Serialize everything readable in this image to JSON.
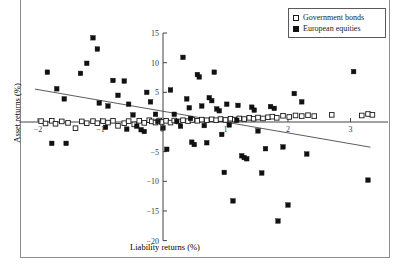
{
  "chart_data": {
    "type": "scatter",
    "title": "",
    "xlabel": "Liability returns (%)",
    "ylabel": "Asset returns (%)",
    "xlim": [
      -2.3,
      3.6
    ],
    "ylim": [
      -21,
      16
    ],
    "xticks": [
      -2,
      -1,
      0,
      1,
      2,
      3
    ],
    "xtick_labels": [
      "−2",
      "−1",
      "0",
      "1",
      "2",
      "3"
    ],
    "yticks": [
      15,
      10,
      5,
      0,
      -5,
      -10,
      -15,
      -20
    ],
    "ytick_labels": [
      "15",
      "10",
      "5",
      "0",
      "−5",
      "−10",
      "−15",
      "−20"
    ],
    "grid": false,
    "legend_position": "top-right",
    "series": [
      {
        "name": "Government bonds",
        "marker": "open-square",
        "color": "#ffffff",
        "edge_color": "#1a1a1a",
        "points": [
          [
            -1.95,
            0.15
          ],
          [
            -1.88,
            -0.25
          ],
          [
            -1.78,
            0.2
          ],
          [
            -1.72,
            -0.3
          ],
          [
            -1.62,
            0.1
          ],
          [
            -1.52,
            -0.15
          ],
          [
            -1.4,
            -1.05
          ],
          [
            -1.3,
            0.1
          ],
          [
            -1.22,
            -0.2
          ],
          [
            -1.12,
            0.15
          ],
          [
            -1.05,
            -0.2
          ],
          [
            -0.96,
            0.15
          ],
          [
            -0.88,
            -0.1
          ],
          [
            -0.8,
            0.2
          ],
          [
            -0.72,
            -0.65
          ],
          [
            -0.62,
            -0.2
          ],
          [
            -0.55,
            0.15
          ],
          [
            -0.46,
            -0.4
          ],
          [
            -0.38,
            0.2
          ],
          [
            -0.3,
            -0.15
          ],
          [
            -0.22,
            0.3
          ],
          [
            -0.18,
            0.1
          ],
          [
            -0.12,
            -0.1
          ],
          [
            -0.06,
            0.25
          ],
          [
            -0.02,
            0.0
          ],
          [
            0.05,
            0.2
          ],
          [
            0.12,
            -0.1
          ],
          [
            0.18,
            0.25
          ],
          [
            0.25,
            0.1
          ],
          [
            0.32,
            0.3
          ],
          [
            0.4,
            0.15
          ],
          [
            0.47,
            0.35
          ],
          [
            0.55,
            0.2
          ],
          [
            0.62,
            0.4
          ],
          [
            0.7,
            0.3
          ],
          [
            0.78,
            0.45
          ],
          [
            0.85,
            0.3
          ],
          [
            0.92,
            0.5
          ],
          [
            1.0,
            0.35
          ],
          [
            1.08,
            0.55
          ],
          [
            1.15,
            0.4
          ],
          [
            1.22,
            0.6
          ],
          [
            1.3,
            0.5
          ],
          [
            1.38,
            0.7
          ],
          [
            1.45,
            0.55
          ],
          [
            1.52,
            0.75
          ],
          [
            1.6,
            0.6
          ],
          [
            1.68,
            0.8
          ],
          [
            1.75,
            0.9
          ],
          [
            1.82,
            0.7
          ],
          [
            1.92,
            1.05
          ],
          [
            2.02,
            0.85
          ],
          [
            2.12,
            1.1
          ],
          [
            2.22,
            1.0
          ],
          [
            2.32,
            1.15
          ],
          [
            2.42,
            1.0
          ],
          [
            2.7,
            1.2
          ],
          [
            3.18,
            1.1
          ],
          [
            3.28,
            1.35
          ],
          [
            3.35,
            1.2
          ]
        ]
      },
      {
        "name": "European equities",
        "marker": "filled-square",
        "color": "#111111",
        "edge_color": "#111111",
        "points": [
          [
            -1.78,
            -3.6
          ],
          [
            -1.55,
            -3.6
          ],
          [
            -1.85,
            8.4
          ],
          [
            -1.7,
            5.6
          ],
          [
            -1.58,
            3.9
          ],
          [
            -1.32,
            8.2
          ],
          [
            -1.22,
            9.9
          ],
          [
            -1.12,
            14.2
          ],
          [
            -1.05,
            12.3
          ],
          [
            -1.02,
            3.2
          ],
          [
            -0.92,
            -0.9
          ],
          [
            -0.88,
            2.7
          ],
          [
            -0.8,
            7.0
          ],
          [
            -0.72,
            4.5
          ],
          [
            -0.62,
            6.9
          ],
          [
            -0.55,
            3.0
          ],
          [
            -0.48,
            1.2
          ],
          [
            -0.42,
            -0.7
          ],
          [
            -0.35,
            -1.3
          ],
          [
            -0.3,
            -1.6
          ],
          [
            -0.26,
            5.0
          ],
          [
            -0.2,
            3.4
          ],
          [
            -0.12,
            1.3
          ],
          [
            -0.08,
            0.1
          ],
          [
            0.0,
            -1.0
          ],
          [
            0.06,
            -4.6
          ],
          [
            0.12,
            5.4
          ],
          [
            0.18,
            1.3
          ],
          [
            0.22,
            0.1
          ],
          [
            0.28,
            -0.7
          ],
          [
            0.32,
            10.9
          ],
          [
            0.38,
            3.9
          ],
          [
            0.42,
            2.4
          ],
          [
            0.46,
            -3.4
          ],
          [
            0.5,
            -3.8
          ],
          [
            0.55,
            8.0
          ],
          [
            0.58,
            7.6
          ],
          [
            0.62,
            2.7
          ],
          [
            0.66,
            -0.6
          ],
          [
            0.7,
            -3.5
          ],
          [
            0.74,
            4.1
          ],
          [
            0.78,
            3.6
          ],
          [
            0.82,
            8.4
          ],
          [
            0.86,
            2.2
          ],
          [
            0.9,
            1.9
          ],
          [
            0.94,
            -2.1
          ],
          [
            0.98,
            -8.5
          ],
          [
            1.02,
            3.0
          ],
          [
            1.06,
            -0.5
          ],
          [
            1.12,
            -13.3
          ],
          [
            1.2,
            2.8
          ],
          [
            1.26,
            -5.7
          ],
          [
            1.3,
            -6.0
          ],
          [
            1.34,
            -6.2
          ],
          [
            1.42,
            2.5
          ],
          [
            1.46,
            2.0
          ],
          [
            1.52,
            -1.5
          ],
          [
            1.58,
            -8.6
          ],
          [
            1.64,
            -4.5
          ],
          [
            1.72,
            2.6
          ],
          [
            1.78,
            2.3
          ],
          [
            1.84,
            -16.7
          ],
          [
            1.92,
            -4.2
          ],
          [
            2.0,
            -14.0
          ],
          [
            2.1,
            4.8
          ],
          [
            2.22,
            3.4
          ],
          [
            2.3,
            -5.4
          ],
          [
            3.05,
            8.5
          ],
          [
            3.28,
            -9.8
          ],
          [
            -0.58,
            -1.2
          ],
          [
            0.44,
            0.6
          ],
          [
            1.18,
            0.3
          ]
        ]
      }
    ],
    "trend_line": {
      "series": "European equities",
      "x_start": -2.05,
      "y_start": 5.55,
      "x_end": 3.32,
      "y_end": -4.25
    }
  },
  "legend": {
    "entries": [
      {
        "label": "Government bonds",
        "marker": "open-square"
      },
      {
        "label": "European equities",
        "marker": "filled-square"
      }
    ]
  }
}
